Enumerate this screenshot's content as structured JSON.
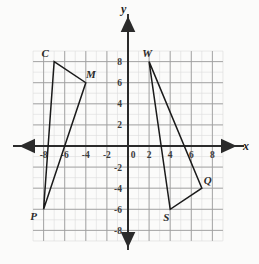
{
  "figure": {
    "background_color": "#fbfbfa",
    "grid": {
      "minor_color": "#d8d8d8",
      "major_color": "#9a9a9a",
      "axis_color": "#2b2b2b",
      "minor_step_units": 1,
      "major_step_units": 2,
      "x_range": [
        -9,
        9
      ],
      "y_range": [
        -9,
        9
      ]
    },
    "axes": {
      "x_label": "x",
      "y_label": "y",
      "origin_label": "0",
      "x_ticks": [
        "-8",
        "-6",
        "-4",
        "-2",
        "2",
        "4",
        "6",
        "8"
      ],
      "y_ticks": [
        "8",
        "6",
        "4",
        "2",
        "-2",
        "-4",
        "-6",
        "-8"
      ],
      "arrowheads": [
        "left",
        "right",
        "up",
        "down"
      ]
    }
  },
  "chart_data": {
    "type": "scatter",
    "xlabel": "x",
    "ylabel": "y",
    "xlim": [
      -9,
      9
    ],
    "ylim": [
      -9,
      9
    ],
    "grid": true,
    "legend": "none",
    "tick_step": 2,
    "minor_tick_step": 1,
    "series": [
      {
        "name": "Triangle CMP",
        "closed": true,
        "stroke": "#1a1a1a",
        "points": [
          {
            "label": "C",
            "x": -7,
            "y": 8,
            "label_dx": -9,
            "label_dy": -5
          },
          {
            "label": "M",
            "x": -4,
            "y": 6,
            "label_dx": 5,
            "label_dy": -5
          },
          {
            "label": "P",
            "x": -8,
            "y": -6,
            "label_dx": -10,
            "label_dy": 11
          }
        ]
      },
      {
        "name": "Triangle WQS",
        "closed": true,
        "stroke": "#1a1a1a",
        "points": [
          {
            "label": "W",
            "x": 2,
            "y": 8,
            "label_dx": -2,
            "label_dy": -5
          },
          {
            "label": "Q",
            "x": 7,
            "y": -4,
            "label_dx": 6,
            "label_dy": -4
          },
          {
            "label": "S",
            "x": 4,
            "y": -6,
            "label_dx": -4,
            "label_dy": 12
          }
        ]
      }
    ]
  }
}
